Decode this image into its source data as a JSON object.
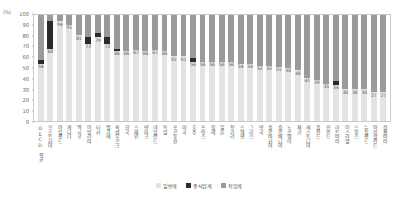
{
  "chart_data": {
    "type": "bar",
    "title": "",
    "xlabel": "",
    "ylabel": "(%)",
    "ylim": [
      0,
      100
    ],
    "ytick_step": 10,
    "yticks": [
      0,
      10,
      20,
      30,
      40,
      50,
      60,
      70,
      80,
      90,
      100
    ],
    "grid": false,
    "stacked": true,
    "legend_position": "bottom",
    "legend": [
      "일반계",
      "중식업계",
      "직업계"
    ],
    "series": [
      {
        "name": "일반계",
        "color": "#e3e3e3",
        "values": [
          54,
          68,
          94,
          91,
          81,
          73,
          79,
          73,
          66,
          66,
          67,
          66,
          67,
          66,
          61,
          61,
          56,
          56,
          56,
          56,
          56,
          54,
          54,
          52,
          52,
          51,
          50,
          48,
          41,
          39,
          35,
          34,
          30,
          30,
          30,
          27,
          27
        ]
      },
      {
        "name": "중식업계",
        "color": "#2b2b2b",
        "values": [
          4,
          26,
          0,
          0,
          0,
          6,
          4,
          6,
          2,
          0,
          0,
          0,
          0,
          0,
          0,
          0,
          3,
          0,
          0,
          0,
          0,
          0,
          0,
          0,
          0,
          0,
          0,
          0,
          0,
          0,
          0,
          4,
          0,
          0,
          0,
          0,
          0
        ]
      },
      {
        "name": "직업계",
        "color": "#9a9a9a",
        "values": [
          42,
          6,
          6,
          9,
          19,
          21,
          17,
          21,
          32,
          34,
          33,
          34,
          33,
          34,
          39,
          39,
          41,
          44,
          44,
          44,
          44,
          46,
          46,
          48,
          48,
          49,
          50,
          52,
          59,
          61,
          65,
          62,
          70,
          70,
          70,
          73,
          73
        ]
      }
    ],
    "categories": [
      "OECD 평균",
      "오스트리아",
      "아일랜드",
      "캐나다",
      "멕시코",
      "이탈리아",
      "터키",
      "벨기에",
      "룩셈부르크",
      "한국",
      "스페인",
      "덴마크",
      "네덜란드",
      "독일",
      "포르투갈",
      "미국",
      "호주",
      "프랑스",
      "칠레",
      "일본",
      "헝가리",
      "스웨덴",
      "그리스",
      "영국",
      "슬로바키아",
      "슬로베니아",
      "노르웨이",
      "체코",
      "에스토니아",
      "폴란드",
      "핀란드",
      "라트비아",
      "이스라엘",
      "스위스",
      "뉴질랜드",
      "아이슬란드",
      "콜롬비아"
    ],
    "value_labels": [
      54,
      68,
      94,
      91,
      81,
      73,
      79,
      73,
      66,
      66,
      67,
      66,
      67,
      66,
      61,
      61,
      56,
      56,
      56,
      56,
      56,
      54,
      54,
      52,
      52,
      51,
      50,
      48,
      41,
      39,
      35,
      34,
      30,
      30,
      30,
      27,
      27
    ]
  }
}
